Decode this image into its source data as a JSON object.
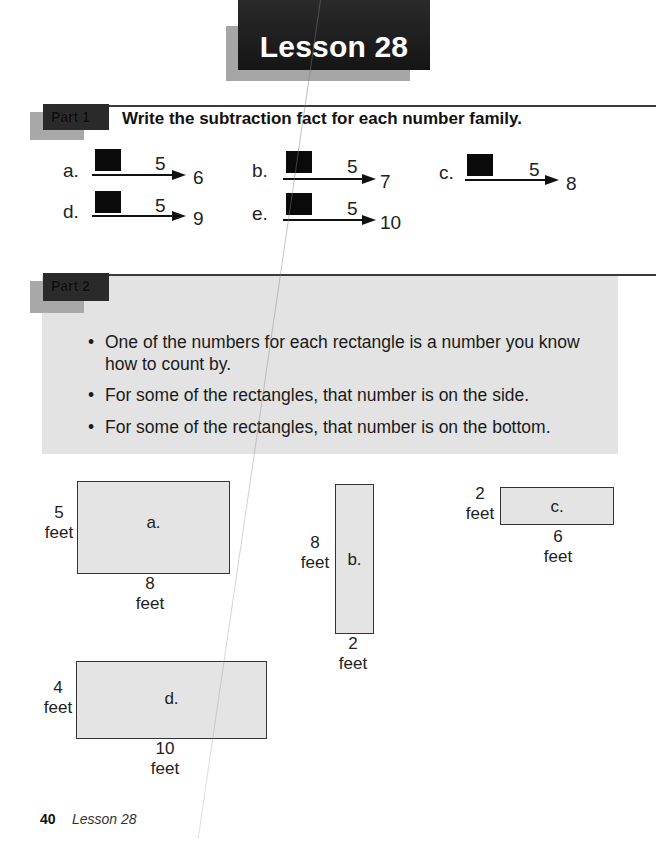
{
  "lesson": {
    "title": "Lesson 28"
  },
  "part1": {
    "tag": "Part 1",
    "instruction": "Write the subtraction fact for each number family.",
    "families": [
      {
        "label": "a.",
        "small": "5",
        "big": "6"
      },
      {
        "label": "b.",
        "small": "5",
        "big": "7"
      },
      {
        "label": "c.",
        "small": "5",
        "big": "8"
      },
      {
        "label": "d.",
        "small": "5",
        "big": "9"
      },
      {
        "label": "e.",
        "small": "5",
        "big": "10"
      }
    ]
  },
  "part2": {
    "tag": "Part 2",
    "bullets": [
      "One of the numbers for each rectangle is a number you know",
      "how to count by.",
      "For some of the rectangles, that number is on the side.",
      "For some of the rectangles, that number is on the bottom."
    ],
    "rectangles": [
      {
        "label": "a.",
        "side": "5",
        "bottom": "8",
        "unit": "feet"
      },
      {
        "label": "b.",
        "side": "8",
        "bottom": "2",
        "unit": "feet"
      },
      {
        "label": "c.",
        "side": "2",
        "bottom": "6",
        "unit": "feet"
      },
      {
        "label": "d.",
        "side": "4",
        "bottom": "10",
        "unit": "feet"
      }
    ]
  },
  "footer": {
    "page_number": "40",
    "lesson_title": "Lesson 28"
  }
}
